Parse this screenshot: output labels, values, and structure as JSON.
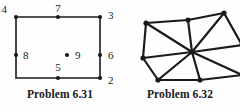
{
  "page": {
    "background_color": "#fefefe",
    "ink_color": "#1a1a1a",
    "width": 240,
    "height": 112
  },
  "figures": [
    {
      "id": "problem-6-31",
      "caption": "Problem 6.31",
      "description": "Rectangular mesh element with numbered nodes",
      "shape": "rectangle",
      "outline": [
        [
          16,
          17
        ],
        [
          100,
          17
        ],
        [
          100,
          78
        ],
        [
          16,
          78
        ]
      ],
      "nodes": [
        {
          "id": "4",
          "label": "4",
          "x": 16,
          "y": 17,
          "label_dx": -9,
          "label_dy": -4,
          "dot": true
        },
        {
          "id": "7",
          "label": "7",
          "x": 58,
          "y": 17,
          "label_dx": 0,
          "label_dy": -5,
          "dot": true
        },
        {
          "id": "3",
          "label": "3",
          "x": 100,
          "y": 17,
          "label_dx": 8,
          "label_dy": -1,
          "dot": true
        },
        {
          "id": "8",
          "label": "8",
          "x": 16,
          "y": 55,
          "label_dx": 7,
          "label_dy": 1,
          "dot": true
        },
        {
          "id": "9",
          "label": "9",
          "x": 67,
          "y": 55,
          "label_dx": 8,
          "label_dy": 1,
          "dot": true
        },
        {
          "id": "6",
          "label": "6",
          "x": 100,
          "y": 55,
          "label_dx": 8,
          "label_dy": 1,
          "dot": true
        },
        {
          "id": "5",
          "label": "5",
          "x": 58,
          "y": 78,
          "label_dx": 0,
          "label_dy": -7,
          "dot": true
        },
        {
          "id": "2",
          "label": "2",
          "x": 100,
          "y": 78,
          "label_dx": 8,
          "label_dy": 3,
          "dot": true
        },
        {
          "id": "1",
          "label": "",
          "x": 16,
          "y": 78,
          "label_dx": 0,
          "label_dy": 0,
          "dot": false
        }
      ],
      "line_width": 1.6,
      "node_radius": 2.1
    },
    {
      "id": "problem-6-32",
      "caption": "Problem 6.32",
      "description": "Irregular triangular mesh with central hub node, clipped at right edge",
      "shape": "triangular-mesh",
      "nodes": [
        {
          "id": "n1",
          "label": "",
          "x": 26,
          "y": 23
        },
        {
          "id": "n2",
          "label": "",
          "x": 68,
          "y": 20
        },
        {
          "id": "n3",
          "label": "",
          "x": 104,
          "y": 13
        },
        {
          "id": "n4",
          "label": "",
          "x": 23,
          "y": 58
        },
        {
          "id": "n5",
          "label": "",
          "x": 72,
          "y": 52
        },
        {
          "id": "n6",
          "label": "",
          "x": 38,
          "y": 80
        },
        {
          "id": "n7",
          "label": "",
          "x": 80,
          "y": 80
        },
        {
          "id": "n8",
          "label": "",
          "x": 122,
          "y": 45
        },
        {
          "id": "n9",
          "label": "",
          "x": 122,
          "y": 75
        }
      ],
      "edges": [
        [
          "n1",
          "n2"
        ],
        [
          "n2",
          "n3"
        ],
        [
          "n1",
          "n4"
        ],
        [
          "n1",
          "n5"
        ],
        [
          "n2",
          "n5"
        ],
        [
          "n3",
          "n5"
        ],
        [
          "n4",
          "n5"
        ],
        [
          "n4",
          "n6"
        ],
        [
          "n5",
          "n6"
        ],
        [
          "n5",
          "n7"
        ],
        [
          "n6",
          "n7"
        ],
        [
          "n5",
          "n8"
        ],
        [
          "n3",
          "n8"
        ],
        [
          "n5",
          "n9"
        ],
        [
          "n7",
          "n9"
        ]
      ],
      "line_width": 2.2,
      "node_radius": 2.6
    }
  ]
}
